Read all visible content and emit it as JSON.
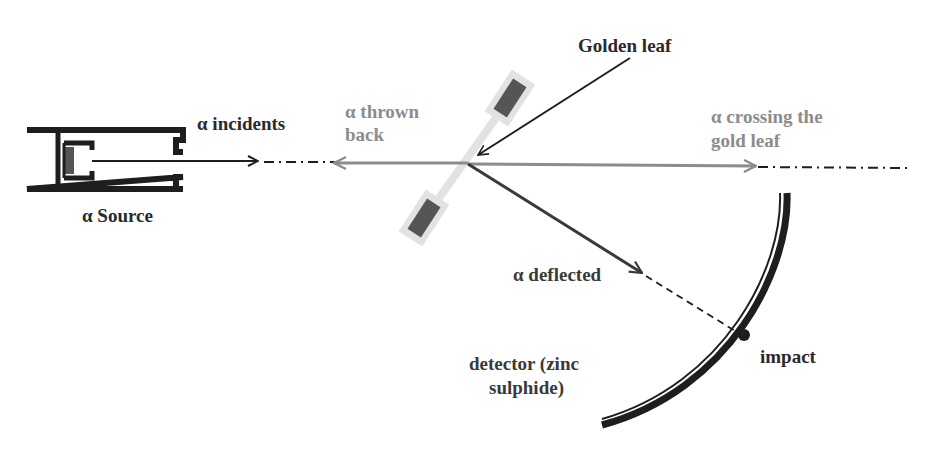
{
  "diagram": {
    "colors": {
      "dark": "#1e1e1e",
      "gray_arrow": "#8c8c8c",
      "deflected": "#3a3a3a",
      "leaf_holder": "#e2e2e2",
      "leaf_block": "#555555"
    },
    "labels": {
      "source": "α Source",
      "incidents": "α incidents",
      "thrown_back_line1": "α thrown",
      "thrown_back_line2": "back",
      "golden_leaf": "Golden leaf",
      "crossing_line1": "α crossing the",
      "crossing_line2": "gold leaf",
      "deflected": "α deflected",
      "detector_line1": "detector (zinc",
      "detector_line2": "sulphide)",
      "impact": "impact"
    },
    "nodes": [
      {
        "id": "source",
        "label": "α Source"
      },
      {
        "id": "gold-leaf",
        "label": "Golden leaf"
      },
      {
        "id": "detector",
        "label": "detector (zinc sulphide)"
      },
      {
        "id": "impact",
        "label": "impact"
      }
    ],
    "edges": [
      {
        "from": "source",
        "to": "gold-leaf",
        "label": "α incidents"
      },
      {
        "from": "gold-leaf",
        "to": "source-side",
        "label": "α thrown back"
      },
      {
        "from": "gold-leaf",
        "to": "beyond",
        "label": "α crossing the gold leaf"
      },
      {
        "from": "gold-leaf",
        "to": "impact",
        "label": "α deflected"
      }
    ]
  }
}
